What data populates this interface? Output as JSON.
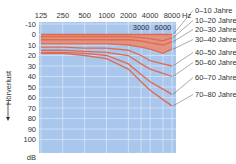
{
  "chart_data": {
    "type": "line",
    "title": "",
    "xlabel": "Hz",
    "ylabel": "Hörverlust",
    "y_unit": "dB",
    "x_scale": "log",
    "x_ticks_top": [
      "125",
      "250",
      "500",
      "1000",
      "2000",
      "4000",
      "8000"
    ],
    "x_ticks_inner": [
      "3000",
      "6000"
    ],
    "y_ticks": [
      -10,
      0,
      10,
      20,
      30,
      40,
      50,
      60,
      70,
      80,
      90,
      100
    ],
    "ylim": [
      -10,
      100
    ],
    "y_inverted": true,
    "grid": true,
    "x": [
      125,
      250,
      500,
      1000,
      2000,
      3000,
      4000,
      6000,
      8000
    ],
    "series": [
      {
        "name": "0–10 Jahre",
        "values": [
          0,
          0,
          0,
          0,
          0,
          0,
          0,
          0,
          0
        ]
      },
      {
        "name": "10–20 Jahre",
        "values": [
          2,
          2,
          2,
          2,
          2,
          3,
          4,
          6,
          3
        ]
      },
      {
        "name": "20–30 Jahre",
        "values": [
          5,
          5,
          5,
          5,
          5,
          6,
          8,
          10,
          7
        ]
      },
      {
        "name": "30–40 Jahre",
        "values": [
          9,
          9,
          9,
          9,
          10,
          12,
          14,
          18,
          14
        ]
      },
      {
        "name": "40–50 Jahre",
        "values": [
          12,
          12,
          13,
          13,
          15,
          20,
          25,
          28,
          30
        ]
      },
      {
        "name": "50–60 Jahre",
        "values": [
          15,
          15,
          16,
          17,
          20,
          28,
          33,
          37,
          40
        ]
      },
      {
        "name": "60–70 Jahre",
        "values": [
          17,
          17,
          18,
          20,
          28,
          38,
          45,
          52,
          57
        ]
      },
      {
        "name": "70–80 Jahre",
        "values": [
          18,
          18,
          20,
          23,
          33,
          45,
          53,
          62,
          68
        ]
      }
    ],
    "legend_position": "right"
  },
  "colors": {
    "plot_bg": "#a9c6ec",
    "grid": "#d8e6f7",
    "line": "#e06a50",
    "band": "#eb8a6e"
  }
}
